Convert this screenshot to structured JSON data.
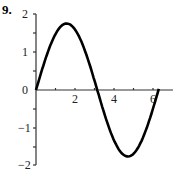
{
  "problem_number": "9.",
  "chart_data": {
    "type": "line",
    "title": "",
    "xlabel": "",
    "ylabel": "",
    "xlim": [
      0,
      7
    ],
    "ylim": [
      -2,
      2
    ],
    "x_ticks": [
      "2",
      "4",
      "6"
    ],
    "y_ticks": [
      "2",
      "1",
      "0",
      "−1",
      "−2"
    ],
    "grid": false,
    "series": [
      {
        "name": "y = 1.75 sin x",
        "x": [
          0,
          0.5,
          1,
          1.57,
          2,
          2.5,
          3,
          3.14,
          3.5,
          4,
          4.71,
          5,
          5.5,
          6,
          6.28
        ],
        "values": [
          0,
          0.84,
          1.47,
          1.75,
          1.59,
          1.05,
          0.25,
          0,
          -0.61,
          -1.32,
          -1.75,
          -1.68,
          -1.23,
          -0.49,
          0
        ]
      }
    ]
  }
}
